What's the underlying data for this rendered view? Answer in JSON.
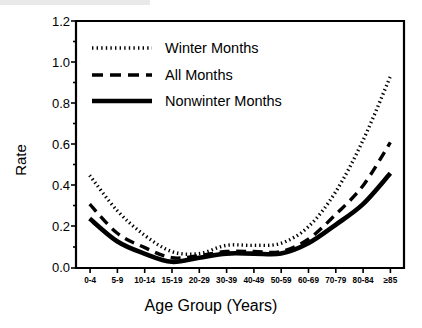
{
  "chart_data": {
    "type": "line",
    "title": "",
    "xlabel": "Age Group (Years)",
    "ylabel": "Rate",
    "categories": [
      "0-4",
      "5-9",
      "10-14",
      "15-19",
      "20-29",
      "30-39",
      "40-49",
      "50-59",
      "60-69",
      "70-79",
      "80-84",
      "≥85"
    ],
    "ylim": [
      0.0,
      1.2
    ],
    "yticks": [
      "0.0",
      "0.2",
      "0.4",
      "0.6",
      "0.8",
      "1.0",
      "1.2"
    ],
    "ytick_values": [
      0.0,
      0.2,
      0.4,
      0.6,
      0.8,
      1.0,
      1.2
    ],
    "grid": false,
    "legend_position": "top-left inside plot area",
    "series": [
      {
        "name": "Winter Months",
        "style": "dotted",
        "color": "#000000",
        "values": [
          0.45,
          0.28,
          0.16,
          0.08,
          0.07,
          0.11,
          0.11,
          0.12,
          0.2,
          0.37,
          0.62,
          0.93
        ]
      },
      {
        "name": "All Months",
        "style": "dashed",
        "color": "#000000",
        "values": [
          0.31,
          0.17,
          0.1,
          0.05,
          0.06,
          0.08,
          0.08,
          0.08,
          0.14,
          0.26,
          0.4,
          0.61
        ]
      },
      {
        "name": "Nonwinter Months",
        "style": "solid",
        "color": "#000000",
        "values": [
          0.24,
          0.13,
          0.07,
          0.03,
          0.05,
          0.07,
          0.07,
          0.07,
          0.12,
          0.21,
          0.31,
          0.46
        ]
      }
    ]
  },
  "legend": {
    "items": [
      {
        "label": "Winter Months",
        "style": "dotted"
      },
      {
        "label": "All Months",
        "style": "dashed"
      },
      {
        "label": "Nonwinter Months",
        "style": "solid"
      }
    ]
  }
}
